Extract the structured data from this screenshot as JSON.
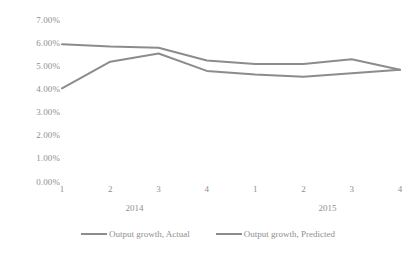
{
  "chart_data": {
    "type": "line",
    "title": "",
    "xlabel": "",
    "ylabel": "",
    "ylim": [
      0,
      7
    ],
    "grid": false,
    "legend_position": "bottom",
    "x": [
      "1",
      "2",
      "3",
      "4",
      "1",
      "2",
      "3",
      "4"
    ],
    "x_groups": [
      "2014",
      "2015"
    ],
    "y_ticks": [
      "0.00%",
      "1.00%",
      "2.00%",
      "3.00%",
      "4.00%",
      "5.00%",
      "6.00%",
      "7.00%"
    ],
    "y_tick_values": [
      0,
      1,
      2,
      3,
      4,
      5,
      6,
      7
    ],
    "series": [
      {
        "name": "Output growth, Actual",
        "color": "#8c8c8c",
        "values": [
          4.05,
          5.2,
          5.55,
          4.8,
          4.65,
          4.55,
          4.7,
          4.85
        ]
      },
      {
        "name": "Output growth, Predicted",
        "color": "#8c8c8c",
        "values": [
          5.95,
          5.85,
          5.8,
          5.25,
          5.1,
          5.1,
          5.3,
          4.85
        ]
      }
    ]
  }
}
